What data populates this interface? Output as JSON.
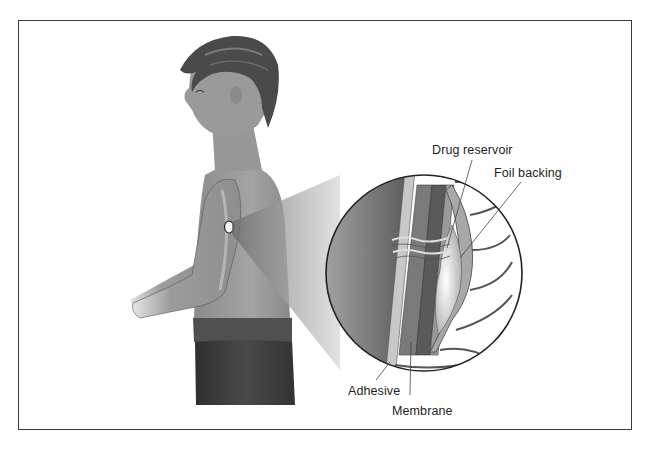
{
  "figure": {
    "labels": {
      "drug_reservoir": "Drug reservoir",
      "foil_backing": "Foil backing",
      "adhesive": "Adhesive",
      "membrane": "Membrane"
    }
  },
  "colors": {
    "frame": "#3a3a3a",
    "skin": "#9a9a9a",
    "hair": "#4a4a4a",
    "pants": "#3c3c3c",
    "background": "#ffffff"
  }
}
